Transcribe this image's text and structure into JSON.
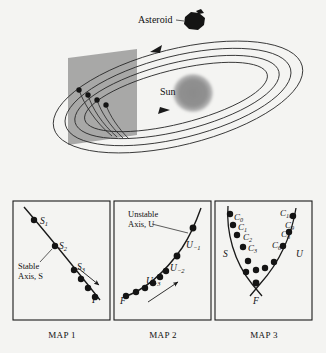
{
  "figure": {
    "type": "diagram",
    "background_color": "#f4f4f2",
    "ink_color": "#1a1a1a"
  },
  "top_panel": {
    "name": "orbit-scene",
    "labels": {
      "asteroid": "Asteroid",
      "sun": "Sun"
    },
    "colors": {
      "section_plane": "#9a9a9a",
      "sun_disk": "#8f8f8f",
      "asteroid_body": "#141414",
      "orbit_stroke": "#2a2a2a"
    },
    "orbit_count": 4,
    "intersection_dot_count": 4,
    "arrow_directions": [
      "left",
      "right"
    ]
  },
  "maps": [
    {
      "id": "map1",
      "caption": "MAP 1",
      "axis_label_line1": "Stable",
      "axis_label_line2": "Axis, S",
      "points": [
        {
          "label": "S",
          "sub": "1"
        },
        {
          "label": "S",
          "sub": "2"
        },
        {
          "label": "S",
          "sub": "3"
        },
        {
          "label": "F",
          "sub": ""
        }
      ],
      "dot_count": 6,
      "arrow": "toward-F"
    },
    {
      "id": "map2",
      "caption": "MAP 2",
      "axis_label_line1": "Unstable",
      "axis_label_line2": "Axis, U",
      "points": [
        {
          "label": "U",
          "sub": "−1"
        },
        {
          "label": "U",
          "sub": "−2"
        },
        {
          "label": "U",
          "sub": "−3"
        },
        {
          "label": "F",
          "sub": ""
        }
      ],
      "dot_count": 8,
      "arrow": "away-from-F"
    },
    {
      "id": "map3",
      "caption": "MAP 3",
      "branch_labels": {
        "stable": "S",
        "unstable": "U",
        "fixed_point": "F"
      },
      "points": [
        {
          "label": "C",
          "sub": "0"
        },
        {
          "label": "C",
          "sub": "1"
        },
        {
          "label": "C",
          "sub": "2"
        },
        {
          "label": "C",
          "sub": "3"
        },
        {
          "label": "C",
          "sub": "6"
        },
        {
          "label": "C",
          "sub": "8"
        },
        {
          "label": "C",
          "sub": "9"
        },
        {
          "label": "C",
          "sub": "10"
        }
      ],
      "dot_count": 13
    }
  ]
}
